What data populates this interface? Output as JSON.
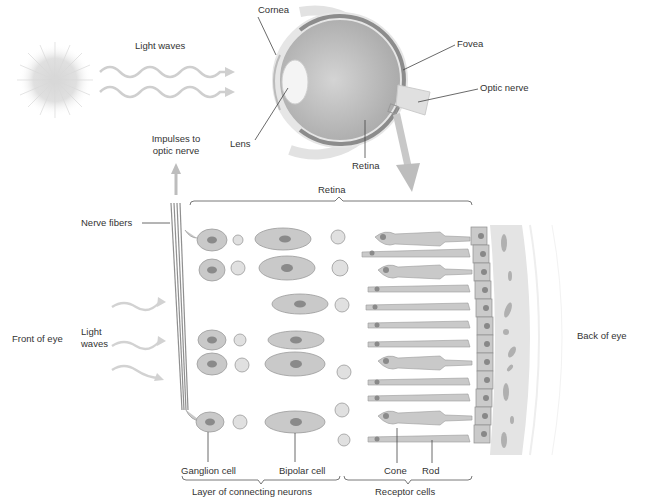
{
  "diagram": {
    "colors": {
      "background": "#ffffff",
      "cell_fill": "#c9c9c9",
      "cell_stroke": "#9a9a9a",
      "nucleus": "#8a8a8a",
      "arrow": "#bdbdbd",
      "light_wave": "#cfcfcf",
      "eye_interior": "#b5b5b5",
      "retina_band": "#8c8c8c",
      "choroid": "#e4e4e4",
      "leader_line": "#444444",
      "text": "#333333"
    },
    "labels": {
      "cornea": "Cornea",
      "light_waves_top": "Light waves",
      "fovea": "Fovea",
      "optic_nerve": "Optic nerve",
      "lens": "Lens",
      "impulses": "Impulses to",
      "impulses_2": "optic nerve",
      "retina_eye": "Retina",
      "retina_bracket": "Retina",
      "nerve_fibers": "Nerve fibers",
      "front_of_eye": "Front of eye",
      "light_waves_left_1": "Light",
      "light_waves_left_2": "waves",
      "back_of_eye": "Back of eye",
      "ganglion_cell": "Ganglion cell",
      "bipolar_cell": "Bipolar cell",
      "cone": "Cone",
      "rod": "Rod",
      "layer_connecting": "Layer of connecting neurons",
      "receptor_cells": "Receptor cells"
    },
    "icons": [
      "sun-icon",
      "light-wave-arrow-icon",
      "eyeball-icon",
      "magnify-arrow-icon",
      "impulse-arrow-icon"
    ]
  }
}
